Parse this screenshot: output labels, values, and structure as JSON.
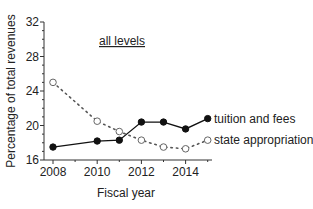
{
  "chart_data": {
    "type": "line",
    "title": "",
    "annotation": "all levels",
    "xlabel": "Fiscal year",
    "ylabel": "Percentage of total revenues",
    "x": [
      2008,
      2010,
      2011,
      2012,
      2013,
      2014,
      2015
    ],
    "xticks": [
      "2008",
      "2010",
      "2012",
      "2014"
    ],
    "yticks": [
      "16",
      "20",
      "24",
      "28",
      "32"
    ],
    "ylim": [
      16,
      32
    ],
    "xlim": [
      2008,
      2015.3
    ],
    "grid": false,
    "legend_position": "inline-right",
    "series": [
      {
        "name": "tuition and fees",
        "marker": "filled-circle",
        "line": "solid",
        "color": "#111111",
        "values": [
          17.5,
          18.2,
          18.3,
          20.4,
          20.4,
          19.6,
          20.8
        ]
      },
      {
        "name": "state appropriations",
        "marker": "open-circle",
        "line": "dotted",
        "color": "#555555",
        "values": [
          25.0,
          20.5,
          19.3,
          18.3,
          17.5,
          17.3,
          18.3
        ]
      }
    ]
  }
}
